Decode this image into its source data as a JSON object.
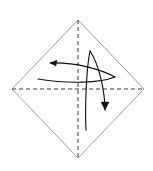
{
  "figure": {
    "background_color": "#ffffff",
    "width": 153,
    "height": 171,
    "caption": ""
  },
  "paper": {
    "shape_name": "square rotated 45 degrees (diamond)",
    "edge_color": "#8e8e8e",
    "fill_color": "#ffffff",
    "edge_width": 0.9,
    "vertices": {
      "top": [
        78,
        20
      ],
      "right": [
        144,
        89
      ],
      "bottom": [
        78,
        158
      ],
      "left": [
        12,
        89
      ]
    }
  },
  "fold_lines": [
    {
      "name": "vertical-fold-line",
      "style": "dashed",
      "color": "#3a3a3a",
      "dash": "4 3",
      "from": [
        78,
        20
      ],
      "to": [
        78,
        158
      ]
    },
    {
      "name": "horizontal-fold-line",
      "style": "dashed",
      "color": "#3a3a3a",
      "dash": "4 3",
      "from": [
        12,
        89
      ],
      "to": [
        144,
        89
      ]
    }
  ],
  "arrows": [
    {
      "name": "fold-arrow-left-upper",
      "direction": "left",
      "color": "#111111",
      "path": "M 115 77 C 100 69, 75 62, 50 63",
      "head_points": "50,63 57,60 56,66",
      "description": "upper curved arrow sweeping right-to-left"
    },
    {
      "name": "fold-arrow-left-lower",
      "direction": "left",
      "color": "#111111",
      "path": "M 115 77 C 100 83, 70 84, 38 79",
      "head_points": "",
      "description": "lower curved tail joining the left arrow near the right"
    },
    {
      "name": "fold-arrow-down-right",
      "direction": "down-right",
      "color": "#111111",
      "path": "M 90 51 C 99 64, 105 92, 105 110",
      "head_points": "105,110 101,102 109,102",
      "description": "curved arrow sweeping from top downward to the right of center"
    },
    {
      "name": "fold-arrow-down-tail",
      "direction": "down-left",
      "color": "#111111",
      "path": "M 90 51 C 86 70, 85 110, 86 130",
      "head_points": "",
      "description": "long curved tail descending below the horizontal fold line"
    }
  ],
  "labels": []
}
